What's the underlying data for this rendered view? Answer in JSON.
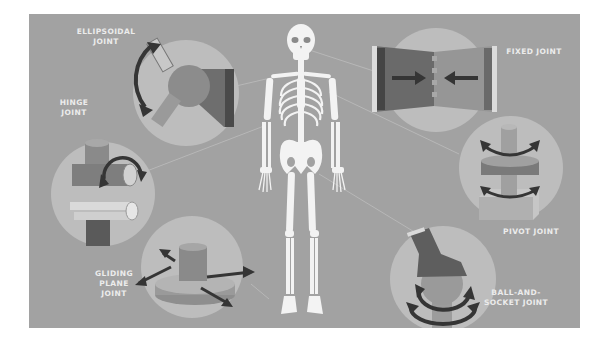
{
  "diagram": {
    "colors": {
      "background": "#a2a2a2",
      "circle": "#bdbdbd",
      "bone": "#f2f2f2",
      "dark_shape": "#5a5a5a",
      "mid_shape": "#8a8a8a",
      "arrow": "#3a3a3a",
      "label_text": "#ececec"
    },
    "labels": {
      "ellipsoidal": {
        "line1": "Ellipsoidal",
        "line2": "Joint"
      },
      "hinge": {
        "line1": "Hinge",
        "line2": "Joint"
      },
      "gliding": {
        "line1": "Gliding",
        "line2": "Plane",
        "line3": "Joint"
      },
      "fixed": {
        "line1": "Fixed Joint"
      },
      "pivot": {
        "line1": "Pivot Joint"
      },
      "ball": {
        "line1": "Ball-and-",
        "line2": "Socket Joint"
      }
    }
  }
}
